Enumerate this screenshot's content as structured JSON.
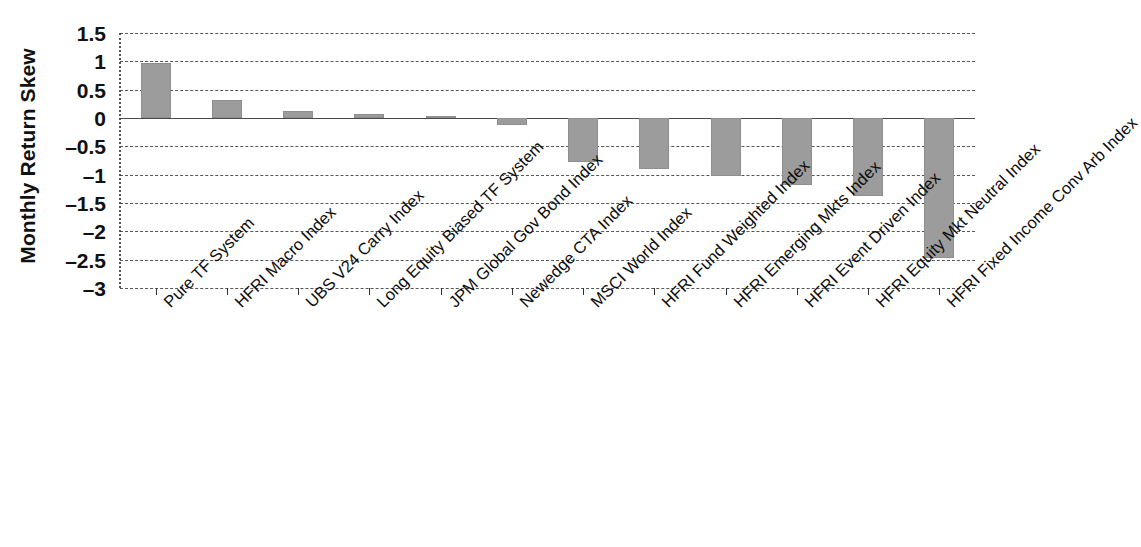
{
  "chart_data": {
    "type": "bar",
    "title": "",
    "subtitle": "",
    "xlabel": "",
    "ylabel": "Monthly Return Skew",
    "orientation": "vertical",
    "grid": true,
    "grid_style": "dashed horizontal",
    "legend": "none",
    "ylim": [
      -3,
      1.5
    ],
    "ytick_step": 0.5,
    "yticks": [
      "1.5",
      "1",
      "0.5",
      "0",
      "–0.5",
      "–1",
      "–1.5",
      "–2",
      "–2.5",
      "–3"
    ],
    "ytick_values": [
      1.5,
      1,
      0.5,
      0,
      -0.5,
      -1,
      -1.5,
      -2,
      -2.5,
      -3
    ],
    "bar_color": "#9c9c9c",
    "bar_edge_color": "#8e8e8e",
    "axis_color": "#4a4a4a",
    "gridline_color": "#3a3a3a",
    "categories": [
      "Pure TF System",
      "HFRI Macro Index",
      "UBS V24 Carry Index",
      "Long Equity Biased TF System",
      "JPM Global Gov Bond Index",
      "Newedge CTA Index",
      "MSCI World Index",
      "HFRI Fund Weighted Index",
      "HFRI Emerging Mkts Index",
      "HFRI Event Driven Index",
      "HFRI Equity Mkt Neutral Index",
      "HFRI Fixed Income Conv Arb Index"
    ],
    "values": [
      0.97,
      0.32,
      0.13,
      0.07,
      0.04,
      -0.12,
      -0.78,
      -0.9,
      -1.03,
      -1.18,
      -1.37,
      -2.47
    ]
  }
}
